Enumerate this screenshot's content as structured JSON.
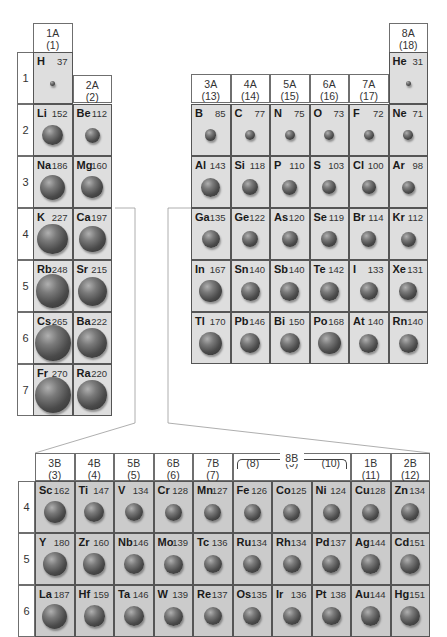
{
  "figure": {
    "left_block": {
      "groups": [
        {
          "label": "1A",
          "number": "(1)"
        },
        {
          "label": "2A",
          "number": "(2)"
        }
      ],
      "periods": [
        "1",
        "2",
        "3",
        "4",
        "5",
        "6",
        "7"
      ],
      "elements": [
        {
          "symbol": "H",
          "radius": 37,
          "group": 0,
          "period": 0
        },
        {
          "symbol": "Li",
          "radius": 152,
          "group": 0,
          "period": 1
        },
        {
          "symbol": "Be",
          "radius": 112,
          "group": 1,
          "period": 1
        },
        {
          "symbol": "Na",
          "radius": 186,
          "group": 0,
          "period": 2
        },
        {
          "symbol": "Mg",
          "radius": 160,
          "group": 1,
          "period": 2
        },
        {
          "symbol": "K",
          "radius": 227,
          "group": 0,
          "period": 3
        },
        {
          "symbol": "Ca",
          "radius": 197,
          "group": 1,
          "period": 3
        },
        {
          "symbol": "Rb",
          "radius": 248,
          "group": 0,
          "period": 4
        },
        {
          "symbol": "Sr",
          "radius": 215,
          "group": 1,
          "period": 4
        },
        {
          "symbol": "Cs",
          "radius": 265,
          "group": 0,
          "period": 5
        },
        {
          "symbol": "Ba",
          "radius": 222,
          "group": 1,
          "period": 5
        },
        {
          "symbol": "Fr",
          "radius": 270,
          "group": 0,
          "period": 6
        },
        {
          "symbol": "Ra",
          "radius": 220,
          "group": 1,
          "period": 6
        }
      ]
    },
    "right_block": {
      "groups": [
        {
          "label": "3A",
          "number": "(13)"
        },
        {
          "label": "4A",
          "number": "(14)"
        },
        {
          "label": "5A",
          "number": "(15)"
        },
        {
          "label": "6A",
          "number": "(16)"
        },
        {
          "label": "7A",
          "number": "(17)"
        },
        {
          "label": "8A",
          "number": "(18)"
        }
      ],
      "elements": [
        {
          "symbol": "He",
          "radius": 31,
          "group": 5,
          "period": 0
        },
        {
          "symbol": "B",
          "radius": 85,
          "group": 0,
          "period": 1
        },
        {
          "symbol": "C",
          "radius": 77,
          "group": 1,
          "period": 1
        },
        {
          "symbol": "N",
          "radius": 75,
          "group": 2,
          "period": 1
        },
        {
          "symbol": "O",
          "radius": 73,
          "group": 3,
          "period": 1
        },
        {
          "symbol": "F",
          "radius": 72,
          "group": 4,
          "period": 1
        },
        {
          "symbol": "Ne",
          "radius": 71,
          "group": 5,
          "period": 1
        },
        {
          "symbol": "Al",
          "radius": 143,
          "group": 0,
          "period": 2
        },
        {
          "symbol": "Si",
          "radius": 118,
          "group": 1,
          "period": 2
        },
        {
          "symbol": "P",
          "radius": 110,
          "group": 2,
          "period": 2
        },
        {
          "symbol": "S",
          "radius": 103,
          "group": 3,
          "period": 2
        },
        {
          "symbol": "Cl",
          "radius": 100,
          "group": 4,
          "period": 2
        },
        {
          "symbol": "Ar",
          "radius": 98,
          "group": 5,
          "period": 2
        },
        {
          "symbol": "Ga",
          "radius": 135,
          "group": 0,
          "period": 3
        },
        {
          "symbol": "Ge",
          "radius": 122,
          "group": 1,
          "period": 3
        },
        {
          "symbol": "As",
          "radius": 120,
          "group": 2,
          "period": 3
        },
        {
          "symbol": "Se",
          "radius": 119,
          "group": 3,
          "period": 3
        },
        {
          "symbol": "Br",
          "radius": 114,
          "group": 4,
          "period": 3
        },
        {
          "symbol": "Kr",
          "radius": 112,
          "group": 5,
          "period": 3
        },
        {
          "symbol": "In",
          "radius": 167,
          "group": 0,
          "period": 4
        },
        {
          "symbol": "Sn",
          "radius": 140,
          "group": 1,
          "period": 4
        },
        {
          "symbol": "Sb",
          "radius": 140,
          "group": 2,
          "period": 4
        },
        {
          "symbol": "Te",
          "radius": 142,
          "group": 3,
          "period": 4
        },
        {
          "symbol": "I",
          "radius": 133,
          "group": 4,
          "period": 4
        },
        {
          "symbol": "Xe",
          "radius": 131,
          "group": 5,
          "period": 4
        },
        {
          "symbol": "Tl",
          "radius": 170,
          "group": 0,
          "period": 5
        },
        {
          "symbol": "Pb",
          "radius": 146,
          "group": 1,
          "period": 5
        },
        {
          "symbol": "Bi",
          "radius": 150,
          "group": 2,
          "period": 5
        },
        {
          "symbol": "Po",
          "radius": 168,
          "group": 3,
          "period": 5
        },
        {
          "symbol": "At",
          "radius": 140,
          "group": 4,
          "period": 5
        },
        {
          "symbol": "Rn",
          "radius": 140,
          "group": 5,
          "period": 5
        }
      ]
    },
    "transition_block": {
      "groups": [
        {
          "label": "3B",
          "number": "(3)"
        },
        {
          "label": "4B",
          "number": "(4)"
        },
        {
          "label": "5B",
          "number": "(5)"
        },
        {
          "label": "6B",
          "number": "(6)"
        },
        {
          "label": "7B",
          "number": "(7)"
        },
        {
          "label": "",
          "number": "(8)"
        },
        {
          "label": "",
          "number": "(9)"
        },
        {
          "label": "",
          "number": "(10)"
        },
        {
          "label": "1B",
          "number": "(11)"
        },
        {
          "label": "2B",
          "number": "(12)"
        }
      ],
      "group_8b_label": "8B",
      "periods": [
        "4",
        "5",
        "6"
      ],
      "elements": [
        {
          "symbol": "Sc",
          "radius": 162,
          "group": 0,
          "period": 0
        },
        {
          "symbol": "Ti",
          "radius": 147,
          "group": 1,
          "period": 0
        },
        {
          "symbol": "V",
          "radius": 134,
          "group": 2,
          "period": 0
        },
        {
          "symbol": "Cr",
          "radius": 128,
          "group": 3,
          "period": 0
        },
        {
          "symbol": "Mn",
          "radius": 127,
          "group": 4,
          "period": 0
        },
        {
          "symbol": "Fe",
          "radius": 126,
          "group": 5,
          "period": 0
        },
        {
          "symbol": "Co",
          "radius": 125,
          "group": 6,
          "period": 0
        },
        {
          "symbol": "Ni",
          "radius": 124,
          "group": 7,
          "period": 0
        },
        {
          "symbol": "Cu",
          "radius": 128,
          "group": 8,
          "period": 0
        },
        {
          "symbol": "Zn",
          "radius": 134,
          "group": 9,
          "period": 0
        },
        {
          "symbol": "Y",
          "radius": 180,
          "group": 0,
          "period": 1
        },
        {
          "symbol": "Zr",
          "radius": 160,
          "group": 1,
          "period": 1
        },
        {
          "symbol": "Nb",
          "radius": 146,
          "group": 2,
          "period": 1
        },
        {
          "symbol": "Mo",
          "radius": 139,
          "group": 3,
          "period": 1
        },
        {
          "symbol": "Tc",
          "radius": 136,
          "group": 4,
          "period": 1
        },
        {
          "symbol": "Ru",
          "radius": 134,
          "group": 5,
          "period": 1
        },
        {
          "symbol": "Rh",
          "radius": 134,
          "group": 6,
          "period": 1
        },
        {
          "symbol": "Pd",
          "radius": 137,
          "group": 7,
          "period": 1
        },
        {
          "symbol": "Ag",
          "radius": 144,
          "group": 8,
          "period": 1
        },
        {
          "symbol": "Cd",
          "radius": 151,
          "group": 9,
          "period": 1
        },
        {
          "symbol": "La",
          "radius": 187,
          "group": 0,
          "period": 2
        },
        {
          "symbol": "Hf",
          "radius": 159,
          "group": 1,
          "period": 2
        },
        {
          "symbol": "Ta",
          "radius": 146,
          "group": 2,
          "period": 2
        },
        {
          "symbol": "W",
          "radius": 139,
          "group": 3,
          "period": 2
        },
        {
          "symbol": "Re",
          "radius": 137,
          "group": 4,
          "period": 2
        },
        {
          "symbol": "Os",
          "radius": 135,
          "group": 5,
          "period": 2
        },
        {
          "symbol": "Ir",
          "radius": 136,
          "group": 6,
          "period": 2
        },
        {
          "symbol": "Pt",
          "radius": 138,
          "group": 7,
          "period": 2
        },
        {
          "symbol": "Au",
          "radius": 144,
          "group": 8,
          "period": 2
        },
        {
          "symbol": "Hg",
          "radius": 151,
          "group": 9,
          "period": 2
        }
      ]
    }
  }
}
